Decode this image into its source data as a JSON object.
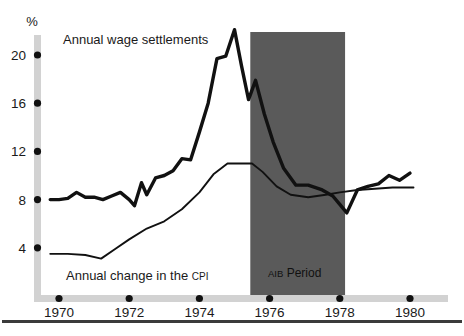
{
  "chart_data": {
    "type": "line",
    "title": "",
    "subtitle": "",
    "xlabel": "",
    "ylabel": "%",
    "xlim": [
      1969.4,
      1980.6
    ],
    "ylim": [
      2.0,
      22.6
    ],
    "grid": false,
    "legend_position": "inline-annotations",
    "x_ticks": [
      "1970",
      "1972",
      "1974",
      "1976",
      "1978",
      "1980"
    ],
    "x_tick_values": [
      1970,
      1972,
      1974,
      1976,
      1978,
      1980
    ],
    "y_ticks": [
      "4",
      "8",
      "12",
      "16",
      "20"
    ],
    "y_tick_values": [
      4,
      8,
      12,
      16,
      20
    ],
    "series": [
      {
        "name": "Annual wage settlements",
        "label": "Annual wage settlements",
        "style": "thick",
        "color": "#111111",
        "x": [
          1969.75,
          1970.0,
          1970.25,
          1970.5,
          1970.75,
          1971.0,
          1971.25,
          1971.5,
          1971.75,
          1972.0,
          1972.15,
          1972.35,
          1972.5,
          1972.75,
          1973.0,
          1973.25,
          1973.5,
          1973.75,
          1974.0,
          1974.25,
          1974.5,
          1974.75,
          1975.0,
          1975.2,
          1975.4,
          1975.6,
          1975.85,
          1976.1,
          1976.4,
          1976.75,
          1977.1,
          1977.5,
          1977.8,
          1978.0,
          1978.2,
          1978.5,
          1978.8,
          1979.1,
          1979.4,
          1979.7,
          1980.0
        ],
        "values": [
          8.0,
          8.0,
          8.1,
          8.6,
          8.2,
          8.2,
          8.0,
          8.3,
          8.6,
          8.0,
          7.5,
          9.4,
          8.4,
          9.8,
          10.0,
          10.4,
          11.4,
          11.3,
          13.6,
          16.0,
          19.7,
          19.9,
          22.1,
          19.1,
          16.3,
          17.9,
          15.1,
          12.8,
          10.6,
          9.2,
          9.2,
          8.8,
          8.3,
          7.6,
          6.9,
          8.8,
          9.1,
          9.3,
          10.0,
          9.6,
          10.2
        ]
      },
      {
        "name": "Annual change in the CPI",
        "label": "Annual change in the CPI",
        "label_prefix": "Annual change in the ",
        "label_smallcaps": "CPI",
        "style": "thin",
        "color": "#111111",
        "x": [
          1969.75,
          1970.25,
          1970.75,
          1971.2,
          1971.6,
          1972.0,
          1972.5,
          1973.0,
          1973.5,
          1974.0,
          1974.4,
          1974.8,
          1975.2,
          1975.5,
          1975.8,
          1976.2,
          1976.6,
          1977.1,
          1977.6,
          1978.0,
          1978.5,
          1979.0,
          1979.5,
          1980.1
        ],
        "values": [
          3.5,
          3.5,
          3.4,
          3.1,
          3.9,
          4.7,
          5.6,
          6.2,
          7.2,
          8.6,
          10.1,
          11.0,
          11.0,
          11.0,
          10.3,
          9.1,
          8.4,
          8.2,
          8.4,
          8.6,
          8.8,
          8.9,
          9.0,
          9.0
        ]
      }
    ],
    "annotations": [
      {
        "name": "aib-period-band",
        "label": "AIB Period",
        "label_smallcaps": "AIB",
        "label_rest": " Period",
        "type": "shaded-region",
        "x_start": 1975.45,
        "x_end": 1978.15,
        "color": "#5a5a5a"
      }
    ],
    "colors": {
      "axis_bar": "#d2d2d2",
      "tick_dot": "#111111",
      "band_fill": "#5a5a5a",
      "line": "#111111",
      "baseline_rule": "#3b3b3b",
      "background": "#ffffff"
    }
  },
  "labels": {
    "y_axis_unit": "%",
    "wage_series": "Annual wage settlements",
    "cpi_series_prefix": "Annual change in the ",
    "cpi_series_smallcaps": "CPI",
    "band_smallcaps": "AIB",
    "band_rest": " Period",
    "tick_1970": "1970",
    "tick_1972": "1972",
    "tick_1974": "1974",
    "tick_1976": "1976",
    "tick_1978": "1978",
    "tick_1980": "1980",
    "tick_4": "4",
    "tick_8": "8",
    "tick_12": "12",
    "tick_16": "16",
    "tick_20": "20"
  }
}
